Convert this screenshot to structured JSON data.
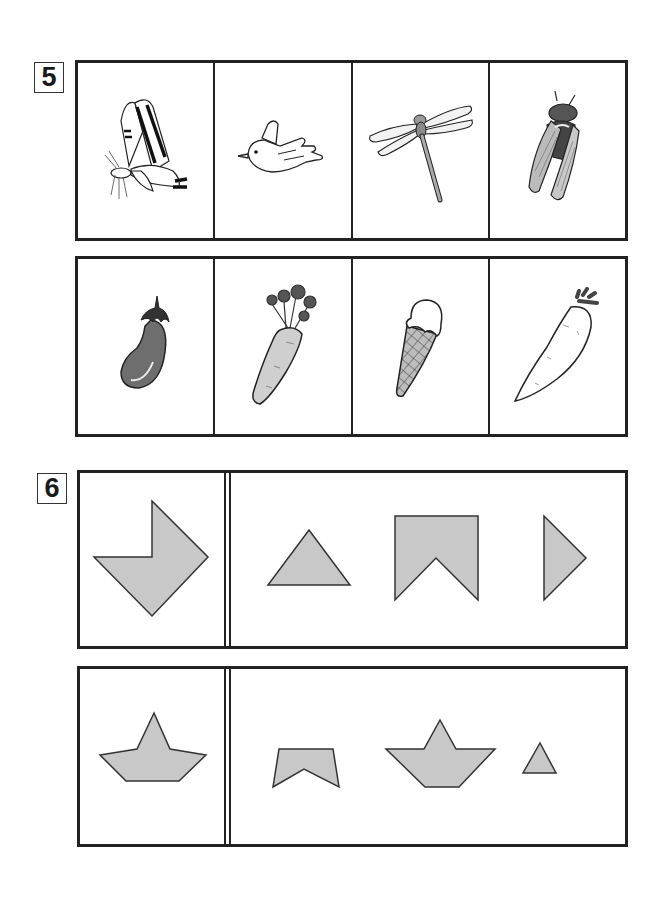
{
  "worksheet": {
    "questions": [
      {
        "number": "5",
        "rows": [
          {
            "items": [
              {
                "name": "butterfly",
                "icon": "butterfly-icon"
              },
              {
                "name": "bird",
                "icon": "bird-icon"
              },
              {
                "name": "dragonfly",
                "icon": "dragonfly-icon"
              },
              {
                "name": "cicada",
                "icon": "cicada-icon"
              }
            ]
          },
          {
            "items": [
              {
                "name": "eggplant",
                "icon": "eggplant-icon"
              },
              {
                "name": "carrot",
                "icon": "carrot-icon"
              },
              {
                "name": "ice cream cone",
                "icon": "ice-cream-icon"
              },
              {
                "name": "daikon radish",
                "icon": "daikon-icon"
              }
            ]
          }
        ]
      },
      {
        "number": "6",
        "rows": [
          {
            "target": "arrow-notch-pentagon",
            "choices": [
              "triangle",
              "notched-rectangle",
              "right-half-triangle"
            ]
          },
          {
            "target": "boat-star",
            "choices": [
              "notched-trapezoid",
              "boat-star",
              "small-triangle"
            ]
          }
        ]
      }
    ],
    "colors": {
      "shape_fill": "#c8c8c8",
      "stroke": "#222222",
      "eggplant": "#6e6e6e",
      "carrot": "#cfcfcf"
    }
  }
}
